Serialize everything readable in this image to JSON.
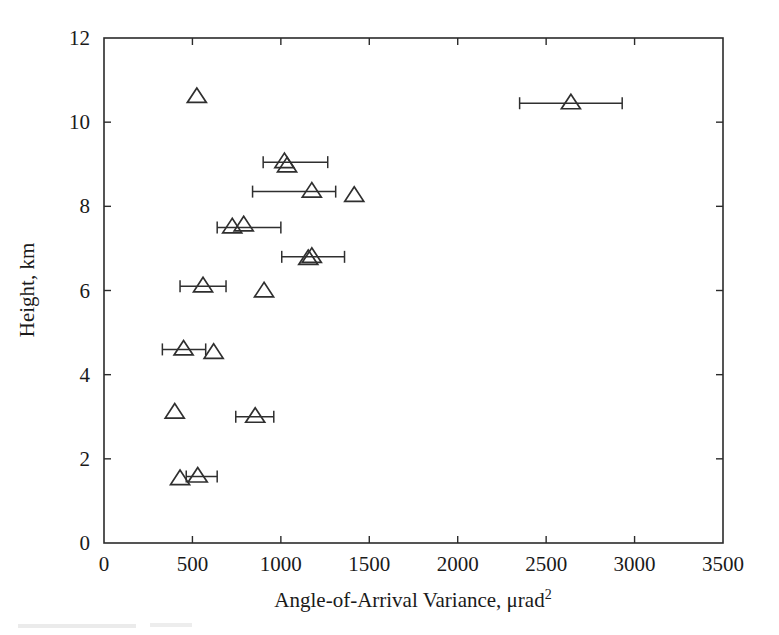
{
  "figure": {
    "background_color": "#ffffff",
    "ink_color": "#2b2b2b",
    "marker_symbol": "open-triangle"
  },
  "chart_data": {
    "type": "scatter",
    "title": "",
    "xlabel": "Angle-of-Arrival Variance, μrad",
    "xlabel_superscript": "2",
    "ylabel": "Height, km",
    "xlim": [
      0,
      3500
    ],
    "ylim": [
      0,
      12
    ],
    "xticks": [
      0,
      500,
      1000,
      1500,
      2000,
      2500,
      3000,
      3500
    ],
    "xticklabels": [
      "0",
      "500",
      "1000",
      "1500",
      "2000",
      "2500",
      "3000",
      "3500"
    ],
    "yticks": [
      0,
      2,
      4,
      6,
      8,
      10,
      12
    ],
    "yticklabels": [
      "0",
      "2",
      "4",
      "6",
      "8",
      "10",
      "12"
    ],
    "grid": false,
    "legend": null,
    "frame": "box",
    "tick_direction": "in",
    "series": [
      {
        "name": "Angle-of-Arrival Variance profile",
        "marker": "open-triangle",
        "points": [
          {
            "x": 2640,
            "y": 10.45,
            "xerr_low": 2350,
            "xerr_high": 2930
          },
          {
            "x": 525,
            "y": 10.6,
            "xerr_low": null,
            "xerr_high": null
          },
          {
            "x": 1020,
            "y": 9.05,
            "xerr_low": 900,
            "xerr_high": 1265
          },
          {
            "x": 1035,
            "y": 8.95,
            "xerr_low": null,
            "xerr_high": null
          },
          {
            "x": 1175,
            "y": 8.35,
            "xerr_low": 840,
            "xerr_high": 1310
          },
          {
            "x": 1415,
            "y": 8.25,
            "xerr_low": null,
            "xerr_high": null
          },
          {
            "x": 725,
            "y": 7.5,
            "xerr_low": 640,
            "xerr_high": 1000
          },
          {
            "x": 790,
            "y": 7.55,
            "xerr_low": null,
            "xerr_high": null
          },
          {
            "x": 1175,
            "y": 6.8,
            "xerr_low": 1005,
            "xerr_high": 1360
          },
          {
            "x": 1155,
            "y": 6.75,
            "xerr_low": null,
            "xerr_high": null
          },
          {
            "x": 560,
            "y": 6.1,
            "xerr_low": 430,
            "xerr_high": 690
          },
          {
            "x": 905,
            "y": 5.98,
            "xerr_low": null,
            "xerr_high": null
          },
          {
            "x": 450,
            "y": 4.6,
            "xerr_low": 330,
            "xerr_high": 575
          },
          {
            "x": 620,
            "y": 4.52,
            "xerr_low": null,
            "xerr_high": null
          },
          {
            "x": 400,
            "y": 3.1,
            "xerr_low": null,
            "xerr_high": null
          },
          {
            "x": 855,
            "y": 3.0,
            "xerr_low": 745,
            "xerr_high": 960
          },
          {
            "x": 430,
            "y": 1.52,
            "xerr_low": null,
            "xerr_high": null
          },
          {
            "x": 530,
            "y": 1.58,
            "xerr_low": 465,
            "xerr_high": 640
          }
        ]
      }
    ]
  }
}
